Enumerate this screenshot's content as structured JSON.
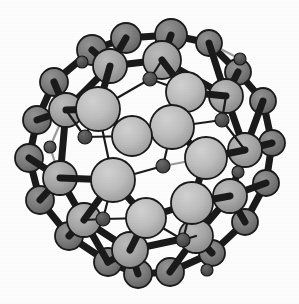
{
  "figure": {
    "kind": "ball-and-stick-molecular-model",
    "background_color": "#fdfdfd",
    "width": 299,
    "height": 304
  },
  "palette": {
    "background": "#fdfdfd",
    "bond_stroke": "#1a1a1a",
    "bond_stroke_back": "#9a9a9a",
    "atom_front_fill": "#b4b4b4",
    "atom_front_highlight": "#c8c8c8",
    "atom_mid_fill": "#a0a0a0",
    "atom_back_fill": "#787878",
    "atom_small_fill": "#555555",
    "atom_outline": "#1a1a1a"
  },
  "atoms": [
    {
      "name": "atom-01",
      "cx": 126,
      "cy": 38,
      "r": 15,
      "layer": "back",
      "fill": "#6e6e6e"
    },
    {
      "name": "atom-02",
      "cx": 171,
      "cy": 35,
      "r": 16,
      "layer": "back",
      "fill": "#6e6e6e"
    },
    {
      "name": "atom-03",
      "cx": 209,
      "cy": 43,
      "r": 13,
      "layer": "back",
      "fill": "#6e6e6e"
    },
    {
      "name": "atom-04",
      "cx": 92,
      "cy": 50,
      "r": 15,
      "layer": "back",
      "fill": "#757575"
    },
    {
      "name": "atom-05",
      "cx": 238,
      "cy": 72,
      "r": 13,
      "layer": "back",
      "fill": "#6e6e6e"
    },
    {
      "name": "atom-06",
      "cx": 54,
      "cy": 82,
      "r": 14,
      "layer": "back",
      "fill": "#757575"
    },
    {
      "name": "atom-07",
      "cx": 263,
      "cy": 101,
      "r": 13,
      "layer": "back",
      "fill": "#6e6e6e"
    },
    {
      "name": "atom-08",
      "cx": 37,
      "cy": 120,
      "r": 14,
      "layer": "back",
      "fill": "#757575"
    },
    {
      "name": "atom-09",
      "cx": 272,
      "cy": 143,
      "r": 13,
      "layer": "back",
      "fill": "#6e6e6e"
    },
    {
      "name": "atom-10",
      "cx": 29,
      "cy": 158,
      "r": 14,
      "layer": "back",
      "fill": "#757575"
    },
    {
      "name": "atom-11",
      "cx": 266,
      "cy": 183,
      "r": 13,
      "layer": "back",
      "fill": "#6e6e6e"
    },
    {
      "name": "atom-12",
      "cx": 40,
      "cy": 200,
      "r": 14,
      "layer": "back",
      "fill": "#757575"
    },
    {
      "name": "atom-13",
      "cx": 245,
      "cy": 222,
      "r": 13,
      "layer": "back",
      "fill": "#6e6e6e"
    },
    {
      "name": "atom-14",
      "cx": 69,
      "cy": 236,
      "r": 14,
      "layer": "back",
      "fill": "#757575"
    },
    {
      "name": "atom-15",
      "cx": 212,
      "cy": 253,
      "r": 13,
      "layer": "back",
      "fill": "#6e6e6e"
    },
    {
      "name": "atom-16",
      "cx": 108,
      "cy": 262,
      "r": 14,
      "layer": "back",
      "fill": "#757575"
    },
    {
      "name": "atom-17",
      "cx": 170,
      "cy": 272,
      "r": 14,
      "layer": "back",
      "fill": "#6e6e6e"
    },
    {
      "name": "atom-18",
      "cx": 138,
      "cy": 274,
      "r": 14,
      "layer": "back",
      "fill": "#6e6e6e"
    },
    {
      "name": "atom-19",
      "cx": 110,
      "cy": 66,
      "r": 17,
      "layer": "mid",
      "fill": "#9e9e9e"
    },
    {
      "name": "atom-20",
      "cx": 162,
      "cy": 60,
      "r": 19,
      "layer": "mid",
      "fill": "#a8a8a8"
    },
    {
      "name": "atom-21",
      "cx": 226,
      "cy": 96,
      "r": 17,
      "layer": "mid",
      "fill": "#9e9e9e"
    },
    {
      "name": "atom-22",
      "cx": 66,
      "cy": 110,
      "r": 17,
      "layer": "mid",
      "fill": "#9e9e9e"
    },
    {
      "name": "atom-23",
      "cx": 245,
      "cy": 150,
      "r": 17,
      "layer": "mid",
      "fill": "#9e9e9e"
    },
    {
      "name": "atom-24",
      "cx": 60,
      "cy": 178,
      "r": 17,
      "layer": "mid",
      "fill": "#9e9e9e"
    },
    {
      "name": "atom-25",
      "cx": 230,
      "cy": 196,
      "r": 17,
      "layer": "mid",
      "fill": "#9e9e9e"
    },
    {
      "name": "atom-26",
      "cx": 84,
      "cy": 220,
      "r": 17,
      "layer": "mid",
      "fill": "#9e9e9e"
    },
    {
      "name": "atom-27",
      "cx": 196,
      "cy": 236,
      "r": 17,
      "layer": "mid",
      "fill": "#9e9e9e"
    },
    {
      "name": "atom-28",
      "cx": 130,
      "cy": 250,
      "r": 18,
      "layer": "mid",
      "fill": "#a4a4a4"
    },
    {
      "name": "atom-29",
      "cx": 98,
      "cy": 109,
      "r": 22,
      "layer": "front",
      "fill": "#b6b6b6"
    },
    {
      "name": "atom-30",
      "cx": 186,
      "cy": 92,
      "r": 20,
      "layer": "front",
      "fill": "#b0b0b0"
    },
    {
      "name": "atom-31",
      "cx": 172,
      "cy": 127,
      "r": 22,
      "layer": "front",
      "fill": "#b8b8b8"
    },
    {
      "name": "atom-32",
      "cx": 132,
      "cy": 136,
      "r": 20,
      "layer": "front",
      "fill": "#b2b2b2"
    },
    {
      "name": "atom-33",
      "cx": 206,
      "cy": 158,
      "r": 21,
      "layer": "front",
      "fill": "#b4b4b4"
    },
    {
      "name": "atom-34",
      "cx": 113,
      "cy": 180,
      "r": 22,
      "layer": "front",
      "fill": "#b6b6b6"
    },
    {
      "name": "atom-35",
      "cx": 192,
      "cy": 203,
      "r": 21,
      "layer": "front",
      "fill": "#b4b4b4"
    },
    {
      "name": "atom-36",
      "cx": 146,
      "cy": 218,
      "r": 20,
      "layer": "front",
      "fill": "#b2b2b2"
    },
    {
      "name": "atom-37",
      "cx": 150,
      "cy": 79,
      "r": 7,
      "layer": "dot",
      "fill": "#4e4e4e"
    },
    {
      "name": "atom-38",
      "cx": 85,
      "cy": 137,
      "r": 7,
      "layer": "dot",
      "fill": "#4e4e4e"
    },
    {
      "name": "atom-39",
      "cx": 163,
      "cy": 166,
      "r": 7,
      "layer": "dot",
      "fill": "#4e4e4e"
    },
    {
      "name": "atom-40",
      "cx": 222,
      "cy": 120,
      "r": 7,
      "layer": "dot",
      "fill": "#4e4e4e"
    },
    {
      "name": "atom-41",
      "cx": 103,
      "cy": 219,
      "r": 7,
      "layer": "dot",
      "fill": "#4e4e4e"
    },
    {
      "name": "atom-42",
      "cx": 183,
      "cy": 240,
      "r": 7,
      "layer": "dot",
      "fill": "#4e4e4e"
    },
    {
      "name": "atom-43",
      "cx": 238,
      "cy": 172,
      "r": 6,
      "layer": "dot",
      "fill": "#4e4e4e"
    },
    {
      "name": "atom-44",
      "cx": 50,
      "cy": 147,
      "r": 6,
      "layer": "dot",
      "fill": "#4e4e4e"
    },
    {
      "name": "atom-45",
      "cx": 82,
      "cy": 62,
      "r": 6,
      "layer": "dot",
      "fill": "#4e4e4e"
    },
    {
      "name": "atom-46",
      "cx": 207,
      "cy": 270,
      "r": 6,
      "layer": "dot",
      "fill": "#4e4e4e"
    },
    {
      "name": "atom-47",
      "cx": 240,
      "cy": 59,
      "r": 6,
      "layer": "dot",
      "fill": "#4e4e4e"
    }
  ],
  "bonds": [
    {
      "name": "bond-back-ring-01",
      "from": "atom-01",
      "to": "atom-02",
      "weight": "thick",
      "depth": "back"
    },
    {
      "name": "bond-back-ring-02",
      "from": "atom-02",
      "to": "atom-03",
      "weight": "thick",
      "depth": "back"
    },
    {
      "name": "bond-back-ring-03",
      "from": "atom-03",
      "to": "atom-05",
      "weight": "thick",
      "depth": "back"
    },
    {
      "name": "bond-back-ring-04",
      "from": "atom-05",
      "to": "atom-07",
      "weight": "thick",
      "depth": "back"
    },
    {
      "name": "bond-back-ring-05",
      "from": "atom-07",
      "to": "atom-09",
      "weight": "thick",
      "depth": "back"
    },
    {
      "name": "bond-back-ring-06",
      "from": "atom-09",
      "to": "atom-11",
      "weight": "thick",
      "depth": "back"
    },
    {
      "name": "bond-back-ring-07",
      "from": "atom-11",
      "to": "atom-13",
      "weight": "thick",
      "depth": "back"
    },
    {
      "name": "bond-back-ring-08",
      "from": "atom-13",
      "to": "atom-15",
      "weight": "thick",
      "depth": "back"
    },
    {
      "name": "bond-back-ring-09",
      "from": "atom-15",
      "to": "atom-17",
      "weight": "thick",
      "depth": "back"
    },
    {
      "name": "bond-back-ring-10",
      "from": "atom-17",
      "to": "atom-18",
      "weight": "thick",
      "depth": "back"
    },
    {
      "name": "bond-back-ring-11",
      "from": "atom-18",
      "to": "atom-16",
      "weight": "thick",
      "depth": "back"
    },
    {
      "name": "bond-back-ring-12",
      "from": "atom-16",
      "to": "atom-14",
      "weight": "thick",
      "depth": "back"
    },
    {
      "name": "bond-back-ring-13",
      "from": "atom-14",
      "to": "atom-12",
      "weight": "thick",
      "depth": "back"
    },
    {
      "name": "bond-back-ring-14",
      "from": "atom-12",
      "to": "atom-10",
      "weight": "thick",
      "depth": "back"
    },
    {
      "name": "bond-back-ring-15",
      "from": "atom-10",
      "to": "atom-08",
      "weight": "thick",
      "depth": "back"
    },
    {
      "name": "bond-back-ring-16",
      "from": "atom-08",
      "to": "atom-06",
      "weight": "thick",
      "depth": "back"
    },
    {
      "name": "bond-back-ring-17",
      "from": "atom-06",
      "to": "atom-04",
      "weight": "thick",
      "depth": "back"
    },
    {
      "name": "bond-back-ring-18",
      "from": "atom-04",
      "to": "atom-01",
      "weight": "thick",
      "depth": "back"
    },
    {
      "name": "bond-spoke-01",
      "from": "atom-04",
      "to": "atom-19",
      "weight": "thick",
      "depth": "mid"
    },
    {
      "name": "bond-spoke-02",
      "from": "atom-01",
      "to": "atom-19",
      "weight": "thick",
      "depth": "mid"
    },
    {
      "name": "bond-spoke-03",
      "from": "atom-02",
      "to": "atom-20",
      "weight": "thick",
      "depth": "mid"
    },
    {
      "name": "bond-spoke-04",
      "from": "atom-03",
      "to": "atom-21",
      "weight": "thick",
      "depth": "mid"
    },
    {
      "name": "bond-spoke-05",
      "from": "atom-05",
      "to": "atom-21",
      "weight": "thick",
      "depth": "mid"
    },
    {
      "name": "bond-spoke-06",
      "from": "atom-06",
      "to": "atom-22",
      "weight": "thick",
      "depth": "mid"
    },
    {
      "name": "bond-spoke-07",
      "from": "atom-08",
      "to": "atom-22",
      "weight": "thick",
      "depth": "mid"
    },
    {
      "name": "bond-spoke-08",
      "from": "atom-07",
      "to": "atom-23",
      "weight": "thick",
      "depth": "mid"
    },
    {
      "name": "bond-spoke-09",
      "from": "atom-09",
      "to": "atom-23",
      "weight": "thick",
      "depth": "mid"
    },
    {
      "name": "bond-spoke-10",
      "from": "atom-10",
      "to": "atom-24",
      "weight": "thick",
      "depth": "mid"
    },
    {
      "name": "bond-spoke-11",
      "from": "atom-12",
      "to": "atom-24",
      "weight": "thick",
      "depth": "mid"
    },
    {
      "name": "bond-spoke-12",
      "from": "atom-11",
      "to": "atom-25",
      "weight": "thick",
      "depth": "mid"
    },
    {
      "name": "bond-spoke-13",
      "from": "atom-13",
      "to": "atom-25",
      "weight": "thick",
      "depth": "mid"
    },
    {
      "name": "bond-spoke-14",
      "from": "atom-14",
      "to": "atom-26",
      "weight": "thick",
      "depth": "mid"
    },
    {
      "name": "bond-spoke-15",
      "from": "atom-16",
      "to": "atom-26",
      "weight": "thick",
      "depth": "mid"
    },
    {
      "name": "bond-spoke-16",
      "from": "atom-15",
      "to": "atom-27",
      "weight": "thick",
      "depth": "mid"
    },
    {
      "name": "bond-spoke-17",
      "from": "atom-17",
      "to": "atom-27",
      "weight": "thick",
      "depth": "mid"
    },
    {
      "name": "bond-spoke-18",
      "from": "atom-18",
      "to": "atom-28",
      "weight": "thick",
      "depth": "mid"
    },
    {
      "name": "bond-spoke-19",
      "from": "atom-16",
      "to": "atom-28",
      "weight": "thick",
      "depth": "mid"
    },
    {
      "name": "bond-mid-ring-01",
      "from": "atom-19",
      "to": "atom-20",
      "weight": "thick",
      "depth": "mid"
    },
    {
      "name": "bond-mid-ring-02",
      "from": "atom-20",
      "to": "atom-21",
      "weight": "thick",
      "depth": "mid"
    },
    {
      "name": "bond-mid-ring-03",
      "from": "atom-21",
      "to": "atom-23",
      "weight": "thick",
      "depth": "mid"
    },
    {
      "name": "bond-mid-ring-04",
      "from": "atom-23",
      "to": "atom-25",
      "weight": "thick",
      "depth": "mid"
    },
    {
      "name": "bond-mid-ring-05",
      "from": "atom-25",
      "to": "atom-27",
      "weight": "thick",
      "depth": "mid"
    },
    {
      "name": "bond-mid-ring-06",
      "from": "atom-27",
      "to": "atom-28",
      "weight": "thick",
      "depth": "mid"
    },
    {
      "name": "bond-mid-ring-07",
      "from": "atom-28",
      "to": "atom-26",
      "weight": "thick",
      "depth": "mid"
    },
    {
      "name": "bond-mid-ring-08",
      "from": "atom-26",
      "to": "atom-24",
      "weight": "thick",
      "depth": "mid"
    },
    {
      "name": "bond-mid-ring-09",
      "from": "atom-24",
      "to": "atom-22",
      "weight": "thick",
      "depth": "mid"
    },
    {
      "name": "bond-mid-ring-10",
      "from": "atom-22",
      "to": "atom-19",
      "weight": "thick",
      "depth": "mid"
    },
    {
      "name": "bond-front-01",
      "from": "atom-29",
      "to": "atom-19",
      "weight": "thick",
      "depth": "front"
    },
    {
      "name": "bond-front-02",
      "from": "atom-29",
      "to": "atom-22",
      "weight": "thick",
      "depth": "front"
    },
    {
      "name": "bond-front-03",
      "from": "atom-30",
      "to": "atom-20",
      "weight": "thick",
      "depth": "front"
    },
    {
      "name": "bond-front-04",
      "from": "atom-30",
      "to": "atom-21",
      "weight": "thick",
      "depth": "front"
    },
    {
      "name": "bond-front-05",
      "from": "atom-33",
      "to": "atom-23",
      "weight": "thick",
      "depth": "front"
    },
    {
      "name": "bond-front-06",
      "from": "atom-35",
      "to": "atom-25",
      "weight": "thick",
      "depth": "front"
    },
    {
      "name": "bond-front-07",
      "from": "atom-36",
      "to": "atom-28",
      "weight": "thick",
      "depth": "front"
    },
    {
      "name": "bond-front-08",
      "from": "atom-34",
      "to": "atom-26",
      "weight": "thick",
      "depth": "front"
    },
    {
      "name": "bond-front-09",
      "from": "atom-34",
      "to": "atom-24",
      "weight": "thick",
      "depth": "front"
    },
    {
      "name": "bond-front-10",
      "from": "atom-29",
      "to": "atom-32",
      "weight": "thick",
      "depth": "front"
    },
    {
      "name": "bond-front-11",
      "from": "atom-32",
      "to": "atom-31",
      "weight": "thick",
      "depth": "front"
    },
    {
      "name": "bond-front-12",
      "from": "atom-31",
      "to": "atom-30",
      "weight": "thick",
      "depth": "front"
    },
    {
      "name": "bond-front-13",
      "from": "atom-31",
      "to": "atom-33",
      "weight": "thick",
      "depth": "front"
    },
    {
      "name": "bond-front-14",
      "from": "atom-33",
      "to": "atom-35",
      "weight": "thick",
      "depth": "front"
    },
    {
      "name": "bond-front-15",
      "from": "atom-35",
      "to": "atom-36",
      "weight": "thick",
      "depth": "front"
    },
    {
      "name": "bond-front-16",
      "from": "atom-36",
      "to": "atom-34",
      "weight": "thick",
      "depth": "front"
    },
    {
      "name": "bond-front-17",
      "from": "atom-34",
      "to": "atom-29",
      "weight": "thin",
      "depth": "front"
    },
    {
      "name": "bond-dot-01",
      "from": "atom-37",
      "to": "atom-20",
      "weight": "thin",
      "depth": "front"
    },
    {
      "name": "bond-dot-02",
      "from": "atom-37",
      "to": "atom-29",
      "weight": "thin",
      "depth": "front"
    },
    {
      "name": "bond-dot-03",
      "from": "atom-37",
      "to": "atom-30",
      "weight": "thin",
      "depth": "front"
    },
    {
      "name": "bond-dot-04",
      "from": "atom-38",
      "to": "atom-29",
      "weight": "thin",
      "depth": "front"
    },
    {
      "name": "bond-dot-05",
      "from": "atom-38",
      "to": "atom-22",
      "weight": "thin",
      "depth": "front"
    },
    {
      "name": "bond-dot-06",
      "from": "atom-38",
      "to": "atom-32",
      "weight": "thin",
      "depth": "front"
    },
    {
      "name": "bond-dot-07",
      "from": "atom-39",
      "to": "atom-31",
      "weight": "thin",
      "depth": "front"
    },
    {
      "name": "bond-dot-08",
      "from": "atom-39",
      "to": "atom-34",
      "weight": "thin",
      "depth": "front"
    },
    {
      "name": "bond-dot-09",
      "from": "atom-39",
      "to": "atom-33",
      "weight": "thin",
      "depth": "back"
    },
    {
      "name": "bond-dot-10",
      "from": "atom-40",
      "to": "atom-21",
      "weight": "thin",
      "depth": "front"
    },
    {
      "name": "bond-dot-11",
      "from": "atom-40",
      "to": "atom-23",
      "weight": "thin",
      "depth": "front"
    },
    {
      "name": "bond-dot-12",
      "from": "atom-40",
      "to": "atom-31",
      "weight": "thin",
      "depth": "front"
    },
    {
      "name": "bond-dot-13",
      "from": "atom-41",
      "to": "atom-34",
      "weight": "thin",
      "depth": "front"
    },
    {
      "name": "bond-dot-14",
      "from": "atom-41",
      "to": "atom-26",
      "weight": "thin",
      "depth": "front"
    },
    {
      "name": "bond-dot-15",
      "from": "atom-41",
      "to": "atom-36",
      "weight": "thin",
      "depth": "front"
    },
    {
      "name": "bond-dot-16",
      "from": "atom-42",
      "to": "atom-35",
      "weight": "thin",
      "depth": "front"
    },
    {
      "name": "bond-dot-17",
      "from": "atom-42",
      "to": "atom-27",
      "weight": "thin",
      "depth": "front"
    },
    {
      "name": "bond-dot-18",
      "from": "atom-42",
      "to": "atom-36",
      "weight": "thin",
      "depth": "front"
    },
    {
      "name": "bond-dot-19",
      "from": "atom-43",
      "to": "atom-23",
      "weight": "thin",
      "depth": "back"
    },
    {
      "name": "bond-dot-20",
      "from": "atom-43",
      "to": "atom-25",
      "weight": "thin",
      "depth": "back"
    },
    {
      "name": "bond-dot-21",
      "from": "atom-44",
      "to": "atom-22",
      "weight": "thin",
      "depth": "back"
    },
    {
      "name": "bond-dot-22",
      "from": "atom-44",
      "to": "atom-24",
      "weight": "thin",
      "depth": "back"
    },
    {
      "name": "bond-dot-23",
      "from": "atom-45",
      "to": "atom-19",
      "weight": "thin",
      "depth": "back"
    },
    {
      "name": "bond-dot-24",
      "from": "atom-45",
      "to": "atom-04",
      "weight": "thin",
      "depth": "back"
    },
    {
      "name": "bond-dot-25",
      "from": "atom-46",
      "to": "atom-15",
      "weight": "thin",
      "depth": "back"
    },
    {
      "name": "bond-dot-26",
      "from": "atom-46",
      "to": "atom-27",
      "weight": "thin",
      "depth": "back"
    },
    {
      "name": "bond-dot-27",
      "from": "atom-47",
      "to": "atom-03",
      "weight": "thin",
      "depth": "back"
    },
    {
      "name": "bond-dot-28",
      "from": "atom-47",
      "to": "atom-05",
      "weight": "thin",
      "depth": "back"
    }
  ]
}
